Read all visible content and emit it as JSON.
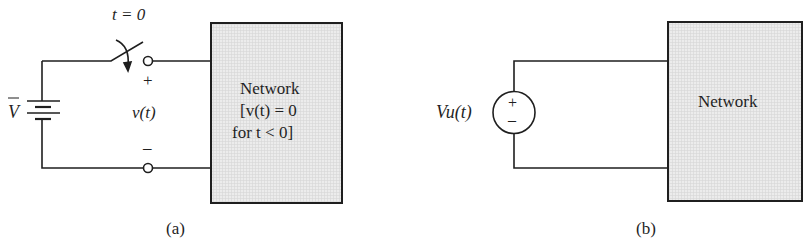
{
  "colors": {
    "ink": "#1f1f1f",
    "box_fill": "#ececec",
    "grid": "#d8d8d8"
  },
  "panel_a": {
    "caption": "(a)",
    "switch_label": "t = 0",
    "battery_label": "V",
    "voltage_label": "v(t)",
    "plus": "+",
    "minus": "–",
    "network": {
      "line1": "Network",
      "line2": "[v(t) = 0",
      "line3": "for t < 0]"
    }
  },
  "panel_b": {
    "caption": "(b)",
    "source_label": "Vu(t)",
    "source_plus": "+",
    "source_minus": "–",
    "network": {
      "line1": "Network"
    }
  }
}
